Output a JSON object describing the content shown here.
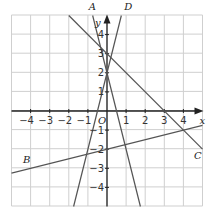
{
  "chart_data": {
    "type": "line",
    "title": "",
    "xlabel": "x",
    "ylabel": "y",
    "origin_label": "O",
    "xlim": [
      -5,
      5
    ],
    "ylim": [
      -5,
      5
    ],
    "grid": true,
    "x_ticks": [
      -4,
      -3,
      -2,
      -1,
      1,
      2,
      3,
      4
    ],
    "x_tick_labels": [
      "−4",
      "−3",
      "−2",
      "−1",
      "1",
      "2",
      "3",
      "4"
    ],
    "y_ticks": [
      -4,
      -3,
      -2,
      -1,
      1,
      2,
      3,
      4
    ],
    "y_tick_labels": [
      "−4",
      "−3",
      "−2",
      "−1",
      "1",
      "2",
      "3",
      "4"
    ],
    "series": [
      {
        "name": "A",
        "equation": "y = -4x + 2",
        "points": [
          [
            -0.75,
            5
          ],
          [
            1.75,
            -5
          ]
        ],
        "label_pos": [
          -0.95,
          5.3
        ]
      },
      {
        "name": "B",
        "equation": "y = 0.25x - 2",
        "points": [
          [
            -5,
            -3.25
          ],
          [
            5,
            -0.75
          ]
        ],
        "label_pos": [
          -4.4,
          -2.7
        ]
      },
      {
        "name": "C",
        "equation": "y = -x + 3",
        "points": [
          [
            -2,
            5
          ],
          [
            5,
            -2
          ]
        ],
        "label_pos": [
          4.55,
          -2.5
        ]
      },
      {
        "name": "D",
        "equation": "y = 4x + 2",
        "points": [
          [
            -1.75,
            -5
          ],
          [
            0.75,
            5
          ]
        ],
        "label_pos": [
          0.9,
          5.3
        ]
      }
    ]
  }
}
